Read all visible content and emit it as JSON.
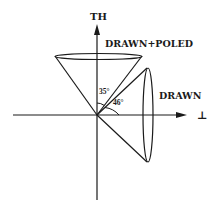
{
  "diagram": {
    "axes": {
      "vertical_label": "TH",
      "horizontal_label": "⊥"
    },
    "cones": [
      {
        "name": "drawn-poled",
        "label": "DRAWN+POLED",
        "angle_label": "35°",
        "orientation": "vertical"
      },
      {
        "name": "drawn",
        "label": "DRAWN",
        "angle_label": "46°",
        "orientation": "horizontal"
      }
    ],
    "colors": {
      "line": "#1a1a1a",
      "background": "#ffffff"
    }
  }
}
